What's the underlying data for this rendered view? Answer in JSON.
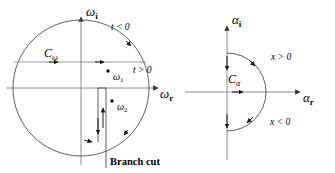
{
  "figure": {
    "background": "#ffffff",
    "stroke_color": "#4d4d4d",
    "axis_color": "#808080",
    "text_color": "#000000",
    "width": 335,
    "height": 173
  },
  "left_panel": {
    "name": "omega-plane",
    "axes": {
      "imaginary_label": "ω",
      "imaginary_subscript": "i",
      "real_label": "ω",
      "real_subscript": "r"
    },
    "contour_label": "C",
    "contour_subscript": "ω",
    "region_labels": [
      {
        "text": "t < 0",
        "position": "upper-right"
      },
      {
        "text": "t > 0",
        "position": "right"
      }
    ],
    "poles": [
      {
        "label": "ω",
        "subscript": "1",
        "marker": "dot"
      },
      {
        "label": "ω",
        "subscript": "2",
        "marker": "dot"
      }
    ],
    "branch_cut_label": "Branch cut",
    "shape": "full-circle-with-vertical-slit"
  },
  "right_panel": {
    "name": "alpha-plane",
    "axes": {
      "imaginary_label": "α",
      "imaginary_subscript": "i",
      "real_label": "α",
      "real_subscript": "r"
    },
    "contour_label": "C",
    "contour_subscript": "α",
    "region_labels": [
      {
        "text": "x > 0",
        "position": "upper-right"
      },
      {
        "text": "x < 0",
        "position": "lower-right"
      }
    ],
    "shape": "right-half-semicircle"
  }
}
